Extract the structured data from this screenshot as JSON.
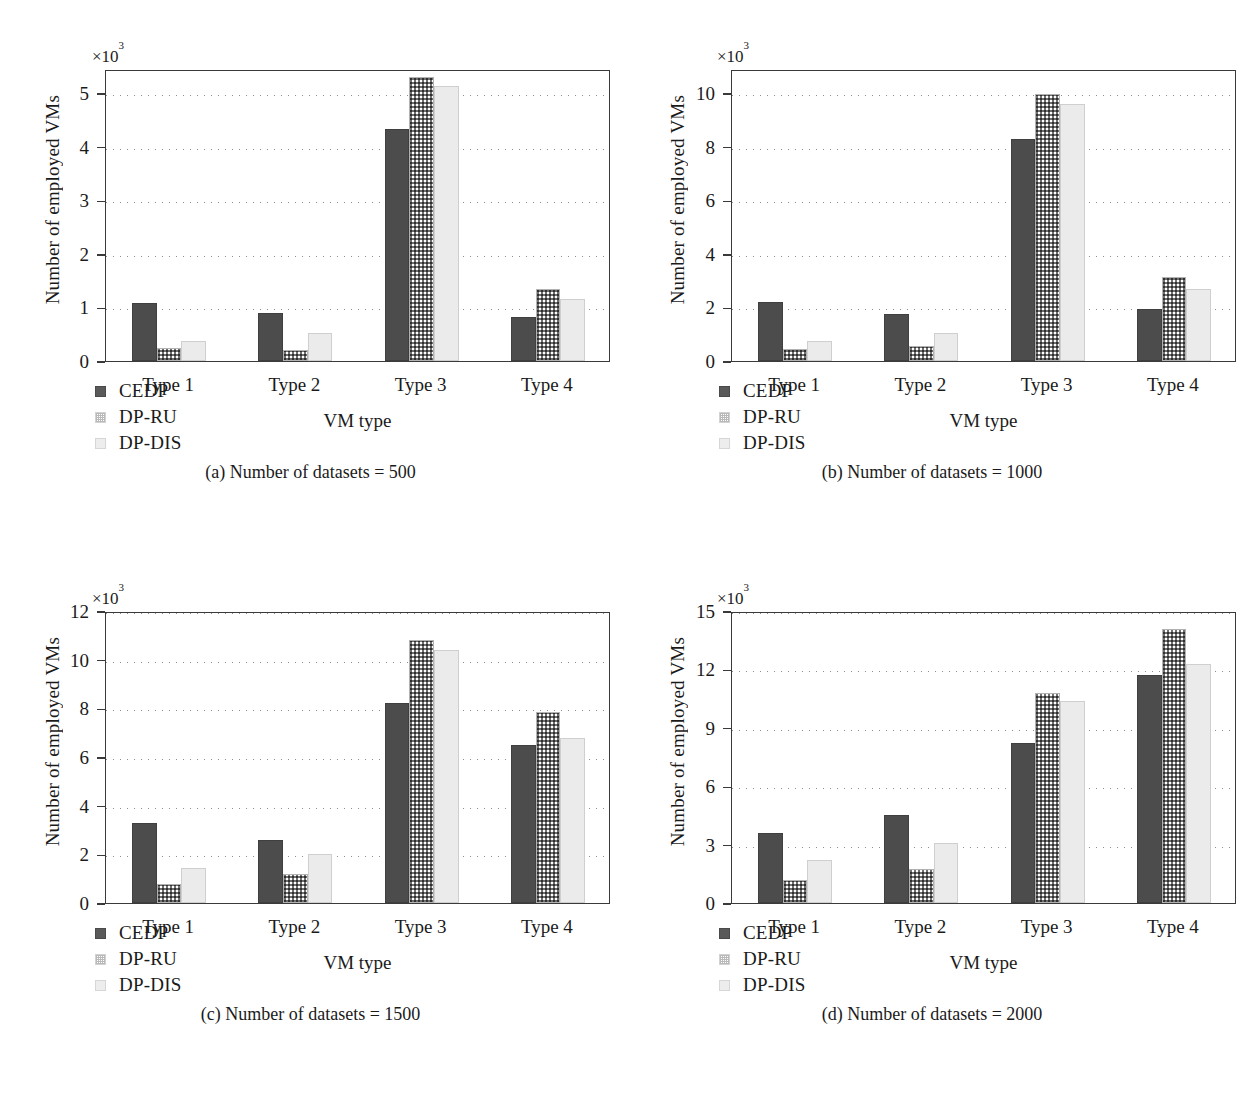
{
  "figure": {
    "series_names": [
      "CEDP",
      "DP-RU",
      "DP-DIS"
    ],
    "colors": {
      "cedp": "#4c4c4c",
      "dpru": "#ffffff",
      "dpdis": "#ebebeb",
      "axis": "#3a3a3a",
      "grid": "#8e8e8e"
    }
  },
  "legend": {
    "items": [
      {
        "label": "CEDP",
        "swatch": "dark-solid-swatch"
      },
      {
        "label": "DP-RU",
        "swatch": "dotted-pattern-swatch"
      },
      {
        "label": "DP-DIS",
        "swatch": "light-gray-swatch"
      }
    ]
  },
  "captions": {
    "a": "(a) Number of datasets = 500",
    "b": "(b) Number of datasets = 1000",
    "c": "(c) Number of datasets = 1500",
    "d": "(d) Number of datasets = 2000"
  },
  "chart_data": [
    {
      "id": "a",
      "type": "bar",
      "title": "(a) Number of datasets = 500",
      "xlabel": "VM type",
      "ylabel": "Number of employed VMs",
      "exponent_label": "×10³",
      "categories": [
        "Type 1",
        "Type 2",
        "Type 3",
        "Type 4"
      ],
      "ylim": [
        0,
        5.45
      ],
      "yticks": [
        0,
        1,
        2,
        3,
        4,
        5
      ],
      "ytick_labels": [
        "0",
        "1",
        "2",
        "3",
        "4",
        "5"
      ],
      "grid": true,
      "legend_position": "below-left",
      "series": [
        {
          "name": "CEDP",
          "values": [
            1.08,
            0.9,
            4.33,
            0.82
          ]
        },
        {
          "name": "DP-RU",
          "values": [
            0.24,
            0.2,
            5.3,
            1.35
          ]
        },
        {
          "name": "DP-DIS",
          "values": [
            0.37,
            0.52,
            5.13,
            1.15
          ]
        }
      ]
    },
    {
      "id": "b",
      "type": "bar",
      "title": "(b) Number of datasets = 1000",
      "xlabel": "VM type",
      "ylabel": "Number of employed VMs",
      "exponent_label": "×10³",
      "categories": [
        "Type 1",
        "Type 2",
        "Type 3",
        "Type 4"
      ],
      "ylim": [
        0,
        10.9
      ],
      "yticks": [
        0,
        2,
        4,
        6,
        8,
        10
      ],
      "ytick_labels": [
        "0",
        "2",
        "4",
        "6",
        "8",
        "10"
      ],
      "grid": true,
      "legend_position": "below-left",
      "series": [
        {
          "name": "CEDP",
          "values": [
            2.2,
            1.75,
            8.3,
            1.95
          ]
        },
        {
          "name": "DP-RU",
          "values": [
            0.45,
            0.55,
            9.95,
            3.15
          ]
        },
        {
          "name": "DP-DIS",
          "values": [
            0.75,
            1.05,
            9.6,
            2.7
          ]
        }
      ]
    },
    {
      "id": "c",
      "type": "bar",
      "title": "(c) Number of datasets = 1500",
      "xlabel": "VM type",
      "ylabel": "Number of employed VMs",
      "exponent_label": "×10³",
      "categories": [
        "Type 1",
        "Type 2",
        "Type 3",
        "Type 4"
      ],
      "ylim": [
        0,
        12.0
      ],
      "yticks": [
        0,
        2,
        4,
        6,
        8,
        10,
        12
      ],
      "ytick_labels": [
        "0",
        "2",
        "4",
        "6",
        "8",
        "10",
        "12"
      ],
      "grid": true,
      "legend_position": "below-left",
      "series": [
        {
          "name": "CEDP",
          "values": [
            3.3,
            2.6,
            8.2,
            6.5
          ]
        },
        {
          "name": "DP-RU",
          "values": [
            0.8,
            1.2,
            10.8,
            7.85
          ]
        },
        {
          "name": "DP-DIS",
          "values": [
            1.45,
            2.0,
            10.4,
            6.8
          ]
        }
      ]
    },
    {
      "id": "d",
      "type": "bar",
      "title": "(d) Number of datasets = 2000",
      "xlabel": "VM type",
      "ylabel": "Number of employed VMs",
      "exponent_label": "×10³",
      "categories": [
        "Type 1",
        "Type 2",
        "Type 3",
        "Type 4"
      ],
      "ylim": [
        0,
        15.0
      ],
      "yticks": [
        0,
        3,
        6,
        9,
        12,
        15
      ],
      "ytick_labels": [
        "0",
        "3",
        "6",
        "9",
        "12",
        "15"
      ],
      "grid": true,
      "legend_position": "below-left",
      "series": [
        {
          "name": "CEDP",
          "values": [
            3.6,
            4.5,
            8.2,
            11.7
          ]
        },
        {
          "name": "DP-RU",
          "values": [
            1.2,
            1.75,
            10.8,
            14.1
          ]
        },
        {
          "name": "DP-DIS",
          "values": [
            2.2,
            3.1,
            10.4,
            12.3
          ]
        }
      ]
    }
  ]
}
